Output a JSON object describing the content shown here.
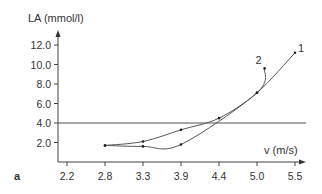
{
  "chart_data": {
    "type": "line",
    "title": "",
    "panel_label": "a",
    "xlabel": "v (m/s)",
    "ylabel": "LA (mmol/l)",
    "x_ticks": [
      "2.2",
      "2.8",
      "3.3",
      "3.9",
      "4.4",
      "5.0",
      "5.5"
    ],
    "y_ticks": [
      "2.0",
      "4.0",
      "6.0",
      "8.0",
      "10.0",
      "12.0"
    ],
    "ylim": [
      0,
      13
    ],
    "xlim": [
      2.2,
      5.6
    ],
    "grid": false,
    "reference_line": {
      "y": 4.0,
      "label": ""
    },
    "series": [
      {
        "name": "1",
        "points": [
          {
            "x": 2.8,
            "y": 1.7
          },
          {
            "x": 3.3,
            "y": 2.1
          },
          {
            "x": 3.9,
            "y": 3.3
          },
          {
            "x": 4.4,
            "y": 4.5
          },
          {
            "x": 5.0,
            "y": 7.1
          },
          {
            "x": 5.5,
            "y": 11.2
          }
        ]
      },
      {
        "name": "2",
        "points": [
          {
            "x": 2.8,
            "y": 1.7
          },
          {
            "x": 3.3,
            "y": 1.6
          },
          {
            "x": 3.9,
            "y": 1.8
          },
          {
            "x": 5.0,
            "y": 7.1
          },
          {
            "x": 5.1,
            "y": 9.6
          }
        ]
      }
    ]
  }
}
